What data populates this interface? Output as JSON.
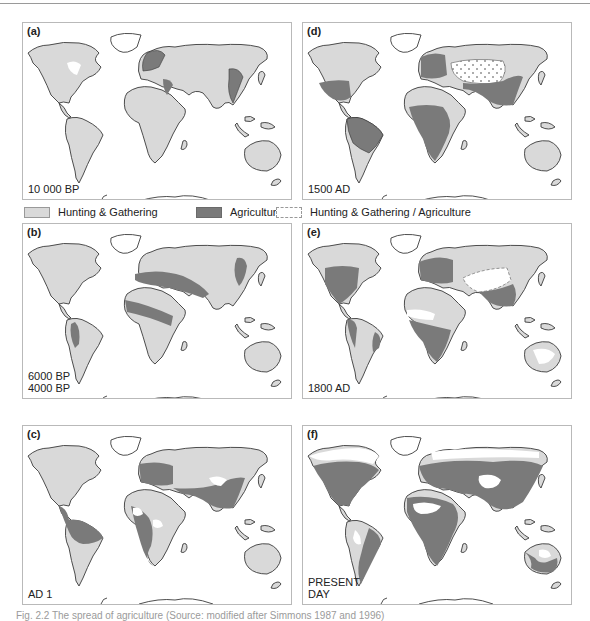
{
  "figure": {
    "colors": {
      "hunting_gathering": "#d9d9d9",
      "agriculture": "#7a7a7a",
      "mixed": "#ffffff",
      "outline": "#3a3a3a",
      "border": "#b9b9b9"
    },
    "legend": [
      {
        "key": "hunting_gathering",
        "label": "Hunting & Gathering"
      },
      {
        "key": "agriculture",
        "label": "Agriculture"
      },
      {
        "key": "mixed",
        "label": "Hunting & Gathering / Agriculture"
      }
    ],
    "panels": [
      {
        "id": "a",
        "label": "(a)",
        "period": "10 000 BP"
      },
      {
        "id": "b",
        "label": "(b)",
        "period": "6000 BP\n4000 BP"
      },
      {
        "id": "c",
        "label": "(c)",
        "period": "AD 1"
      },
      {
        "id": "d",
        "label": "(d)",
        "period": "1500 AD"
      },
      {
        "id": "e",
        "label": "(e)",
        "period": "1800 AD"
      },
      {
        "id": "f",
        "label": "(f)",
        "period": "PRESENT\nDAY"
      }
    ],
    "caption": "Fig. 2.2 The spread of agriculture (Source: modified after Simmons 1987 and 1996)"
  }
}
